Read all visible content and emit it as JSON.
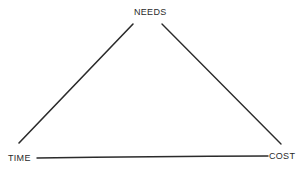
{
  "diagram": {
    "type": "triangle",
    "vertices": {
      "top": {
        "label": "NEEDS"
      },
      "bottom_left": {
        "label": "TIME"
      },
      "bottom_right": {
        "label": "COST"
      }
    },
    "edges": [
      {
        "from": "TIME",
        "to": "NEEDS"
      },
      {
        "from": "NEEDS",
        "to": "COST"
      },
      {
        "from": "TIME",
        "to": "COST"
      }
    ],
    "colors": {
      "line": "#2b2b2b",
      "text": "#2a2a2a",
      "background": "#ffffff"
    }
  }
}
